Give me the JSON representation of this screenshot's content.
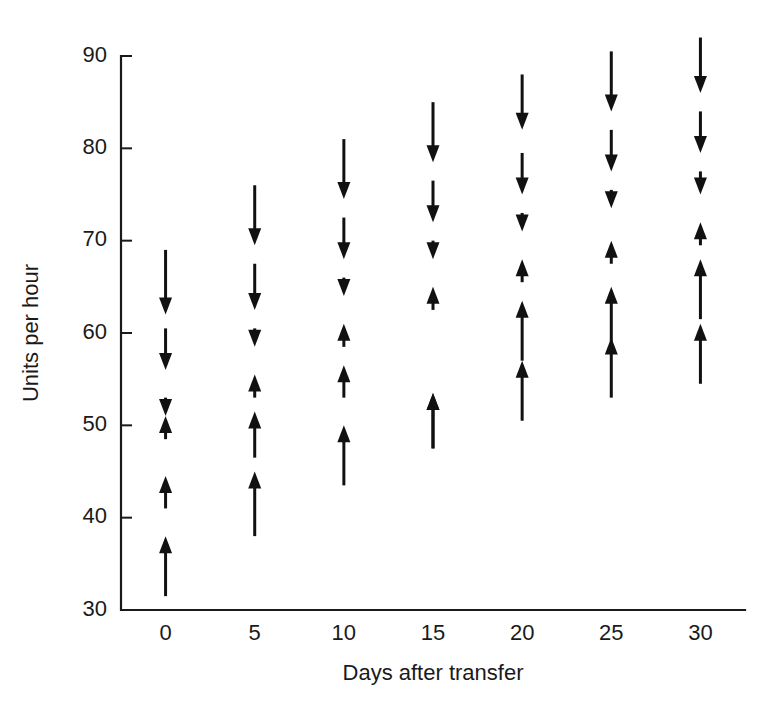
{
  "chart_data": {
    "type": "scatter",
    "title": "",
    "subtitle": "",
    "xlabel": "Days after transfer",
    "ylabel": "Units per hour",
    "xlim": [
      -2.5,
      32.5
    ],
    "ylim": [
      30,
      90
    ],
    "xticks": [
      0,
      5,
      10,
      15,
      20,
      25,
      30
    ],
    "xtick_labels": [
      "0",
      "5",
      "10",
      "15",
      "20",
      "25",
      "30"
    ],
    "yticks": [
      30,
      40,
      50,
      60,
      70,
      80,
      90
    ],
    "ytick_labels": [
      "30",
      "40",
      "50",
      "60",
      "70",
      "80",
      "90"
    ],
    "grid": false,
    "legend": null,
    "annotations": [],
    "marker_style": "vertical-arrow-ranges",
    "series": [
      {
        "name": "Day 0",
        "x": 0,
        "arrows": [
          {
            "from": 69.0,
            "to": 62.0,
            "direction": "down"
          },
          {
            "from": 60.5,
            "to": 56.0,
            "direction": "down"
          },
          {
            "from": 53.0,
            "to": 51.0,
            "direction": "down"
          },
          {
            "from": 48.5,
            "to": 51.0,
            "direction": "up"
          },
          {
            "from": 41.0,
            "to": 44.5,
            "direction": "up"
          },
          {
            "from": 31.5,
            "to": 38.0,
            "direction": "up"
          }
        ]
      },
      {
        "name": "Day 5",
        "x": 5,
        "arrows": [
          {
            "from": 76.0,
            "to": 69.5,
            "direction": "down"
          },
          {
            "from": 67.5,
            "to": 62.5,
            "direction": "down"
          },
          {
            "from": 60.5,
            "to": 58.5,
            "direction": "down"
          },
          {
            "from": 53.0,
            "to": 55.5,
            "direction": "up"
          },
          {
            "from": 46.5,
            "to": 51.5,
            "direction": "up"
          },
          {
            "from": 38.0,
            "to": 45.0,
            "direction": "up"
          }
        ]
      },
      {
        "name": "Day 10",
        "x": 10,
        "arrows": [
          {
            "from": 81.0,
            "to": 74.5,
            "direction": "down"
          },
          {
            "from": 72.5,
            "to": 68.0,
            "direction": "down"
          },
          {
            "from": 66.0,
            "to": 64.0,
            "direction": "down"
          },
          {
            "from": 58.5,
            "to": 61.0,
            "direction": "up"
          },
          {
            "from": 53.0,
            "to": 56.5,
            "direction": "up"
          },
          {
            "from": 43.5,
            "to": 50.0,
            "direction": "up"
          }
        ]
      },
      {
        "name": "Day 15",
        "x": 15,
        "arrows": [
          {
            "from": 85.0,
            "to": 78.5,
            "direction": "down"
          },
          {
            "from": 76.5,
            "to": 72.0,
            "direction": "down"
          },
          {
            "from": 70.0,
            "to": 68.0,
            "direction": "down"
          },
          {
            "from": 62.5,
            "to": 65.0,
            "direction": "up"
          },
          {
            "from": 47.5,
            "to": 53.5,
            "direction": "up"
          },
          {
            "from": 47.5,
            "to": 53.5,
            "direction": "up"
          }
        ]
      },
      {
        "name": "Day 20",
        "x": 20,
        "arrows": [
          {
            "from": 88.0,
            "to": 82.0,
            "direction": "down"
          },
          {
            "from": 79.5,
            "to": 75.0,
            "direction": "down"
          },
          {
            "from": 73.0,
            "to": 71.0,
            "direction": "down"
          },
          {
            "from": 65.5,
            "to": 68.0,
            "direction": "up"
          },
          {
            "from": 57.0,
            "to": 63.5,
            "direction": "up"
          },
          {
            "from": 50.5,
            "to": 57.0,
            "direction": "up"
          }
        ]
      },
      {
        "name": "Day 25",
        "x": 25,
        "arrows": [
          {
            "from": 90.5,
            "to": 84.0,
            "direction": "down"
          },
          {
            "from": 82.0,
            "to": 77.5,
            "direction": "down"
          },
          {
            "from": 75.5,
            "to": 73.5,
            "direction": "down"
          },
          {
            "from": 67.5,
            "to": 70.0,
            "direction": "up"
          },
          {
            "from": 59.0,
            "to": 65.0,
            "direction": "up"
          },
          {
            "from": 53.0,
            "to": 59.5,
            "direction": "up"
          }
        ]
      },
      {
        "name": "Day 30",
        "x": 30,
        "arrows": [
          {
            "from": 92.0,
            "to": 86.0,
            "direction": "down"
          },
          {
            "from": 84.0,
            "to": 79.5,
            "direction": "down"
          },
          {
            "from": 77.5,
            "to": 75.0,
            "direction": "down"
          },
          {
            "from": 69.5,
            "to": 72.0,
            "direction": "up"
          },
          {
            "from": 61.5,
            "to": 68.0,
            "direction": "up"
          },
          {
            "from": 54.5,
            "to": 61.0,
            "direction": "up"
          }
        ]
      }
    ]
  }
}
